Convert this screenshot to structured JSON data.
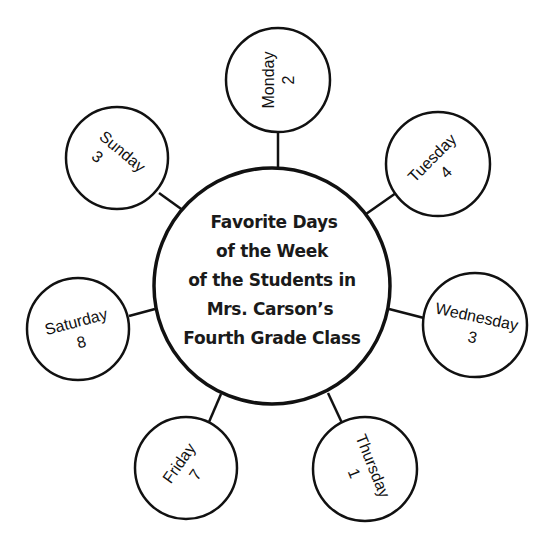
{
  "diagram": {
    "type": "web",
    "title_lines": [
      "Favorite Days",
      "of the Week",
      "of the Students in",
      "Mrs. Carson’s",
      "Fourth Grade Class"
    ],
    "days": [
      {
        "name": "Monday",
        "count": "2"
      },
      {
        "name": "Tuesday",
        "count": "4"
      },
      {
        "name": "Wednesday",
        "count": "3"
      },
      {
        "name": "Thursday",
        "count": "1"
      },
      {
        "name": "Friday",
        "count": "7"
      },
      {
        "name": "Saturday",
        "count": "8"
      },
      {
        "name": "Sunday",
        "count": "3"
      }
    ]
  },
  "colors": {
    "stroke": "#111111",
    "background": "#ffffff"
  }
}
